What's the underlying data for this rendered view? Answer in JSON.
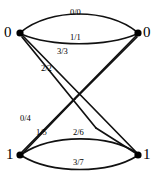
{
  "diagram": {
    "type": "state-transition-diagram",
    "title": "",
    "background_color": "#ffffff",
    "edge_color": "#111111",
    "node_color": "#000000",
    "nodes": [
      {
        "id": "s0-left",
        "label": "0",
        "x": 20,
        "y": 33,
        "label_x": 4,
        "label_y": 25
      },
      {
        "id": "s0-right",
        "label": "0",
        "x": 138,
        "y": 33,
        "label_x": 143,
        "label_y": 25
      },
      {
        "id": "s1-left",
        "label": "1",
        "x": 20,
        "y": 155,
        "label_x": 6,
        "label_y": 147
      },
      {
        "id": "s1-right",
        "label": "1",
        "x": 138,
        "y": 155,
        "label_x": 143,
        "label_y": 147
      }
    ],
    "edges": [
      {
        "id": "e-00",
        "label": "0/0",
        "from": "s0-left",
        "to": "s0-right",
        "label_x": 70,
        "label_y": 8
      },
      {
        "id": "e-11",
        "label": "1/1",
        "from": "s0-left",
        "to": "s0-right",
        "label_x": 70,
        "label_y": 33
      },
      {
        "id": "e-33",
        "label": "3/3",
        "from": "s0-left",
        "to": "s1-right",
        "label_x": 57,
        "label_y": 47
      },
      {
        "id": "e-22",
        "label": "2/2",
        "from": "s0-left",
        "to": "s1-right",
        "label_x": 41,
        "label_y": 64
      },
      {
        "id": "e-04",
        "label": "0/4",
        "from": "s1-left",
        "to": "s0-right",
        "label_x": 20,
        "label_y": 114
      },
      {
        "id": "e-15",
        "label": "1/5",
        "from": "s1-left",
        "to": "s0-right",
        "label_x": 36,
        "label_y": 128
      },
      {
        "id": "e-26",
        "label": "2/6",
        "from": "s1-left",
        "to": "s1-right",
        "label_x": 73,
        "label_y": 128
      },
      {
        "id": "e-37",
        "label": "3/7",
        "from": "s1-left",
        "to": "s1-right",
        "label_x": 73,
        "label_y": 158
      }
    ]
  }
}
